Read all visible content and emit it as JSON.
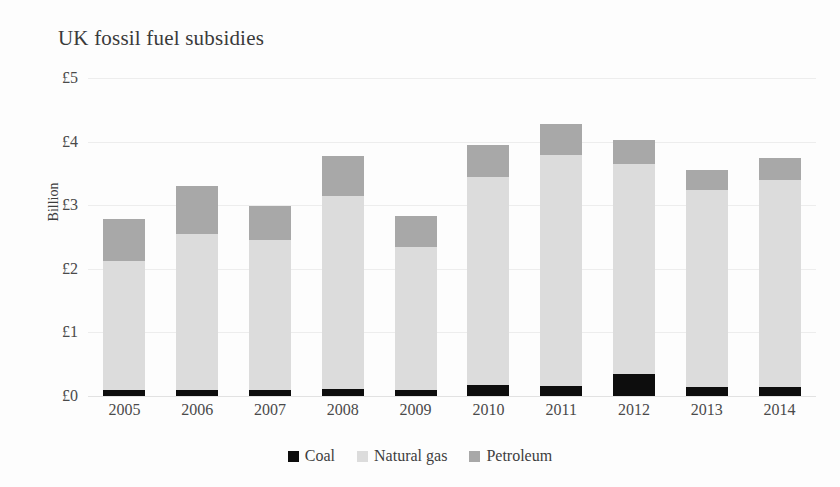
{
  "chart_data": {
    "type": "bar",
    "subtype": "stacked-bar",
    "title": "UK fossil fuel subsidies",
    "xlabel": "",
    "ylabel": "Billion",
    "categories": [
      "2005",
      "2006",
      "2007",
      "2008",
      "2009",
      "2010",
      "2011",
      "2012",
      "2013",
      "2014"
    ],
    "series": [
      {
        "name": "Coal",
        "color": "#0d0d0d",
        "values": [
          0.09,
          0.09,
          0.09,
          0.11,
          0.09,
          0.17,
          0.16,
          0.35,
          0.14,
          0.14
        ]
      },
      {
        "name": "Natural gas",
        "color": "#dcdcdc",
        "values": [
          2.03,
          2.45,
          2.36,
          3.03,
          2.25,
          3.27,
          3.63,
          3.3,
          3.1,
          3.25
        ]
      },
      {
        "name": "Petroleum",
        "color": "#a8a8a8",
        "values": [
          0.66,
          0.76,
          0.54,
          0.63,
          0.49,
          0.5,
          0.49,
          0.38,
          0.31,
          0.36
        ]
      }
    ],
    "totals": [
      2.78,
      3.3,
      2.99,
      3.77,
      2.83,
      3.95,
      4.28,
      4.03,
      3.55,
      3.76
    ],
    "ylim": [
      0,
      5
    ],
    "ytick_values": [
      0,
      1,
      2,
      3,
      4,
      5
    ],
    "ytick_labels": [
      "£0",
      "£1",
      "£2",
      "£3",
      "£4",
      "£5"
    ],
    "grid": true,
    "grid_axis": "y",
    "legend_position": "bottom",
    "legend_entries": [
      "Coal",
      "Natural gas",
      "Petroleum"
    ],
    "currency_symbol": "£",
    "units": "Billion"
  }
}
